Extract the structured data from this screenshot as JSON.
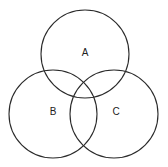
{
  "diagram": {
    "type": "venn",
    "sets": [
      {
        "label": "A",
        "cx": 85,
        "cy": 54,
        "r": 44,
        "label_x": 85,
        "label_y": 52
      },
      {
        "label": "B",
        "cx": 53,
        "cy": 114,
        "r": 44,
        "label_x": 53,
        "label_y": 111
      },
      {
        "label": "C",
        "cx": 114,
        "cy": 114,
        "r": 44,
        "label_x": 116,
        "label_y": 111
      }
    ],
    "stroke_color": "#2a2a2a",
    "background": "#ffffff"
  }
}
